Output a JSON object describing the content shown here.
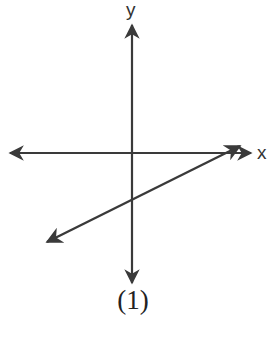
{
  "figure": {
    "caption": "(1)",
    "axes": {
      "x_label": "x",
      "y_label": "y"
    },
    "colors": {
      "stroke": "#3a3a3a",
      "text": "#222222",
      "background": "#ffffff"
    },
    "elements": [
      {
        "type": "x-axis",
        "description": "horizontal double-headed arrow"
      },
      {
        "type": "y-axis",
        "description": "vertical double-headed arrow"
      },
      {
        "type": "line",
        "description": "line with positive slope, crossing the y-axis below the origin and the x-axis to the right of the origin; arrowheads at both ends"
      }
    ]
  }
}
